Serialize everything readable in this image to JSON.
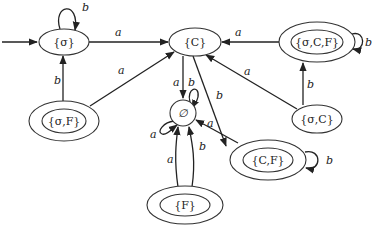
{
  "diagram": {
    "type": "finite-automaton",
    "start_state": "sigma",
    "states": {
      "sigma": {
        "label": "{σ}",
        "accepting": false
      },
      "C": {
        "label": "{C}",
        "accepting": false
      },
      "sigma_C_F": {
        "label": "{σ,C,F}",
        "accepting": true
      },
      "sigma_F": {
        "label": "{σ,F}",
        "accepting": true
      },
      "sigma_C": {
        "label": "{σ,C}",
        "accepting": false
      },
      "empty": {
        "label": "∅",
        "accepting": false
      },
      "C_F": {
        "label": "{C,F}",
        "accepting": true
      },
      "F": {
        "label": "{F}",
        "accepting": true
      }
    },
    "transitions": [
      {
        "from": "sigma",
        "to": "sigma",
        "symbol": "b"
      },
      {
        "from": "sigma",
        "to": "C",
        "symbol": "a"
      },
      {
        "from": "sigma_F",
        "to": "sigma",
        "symbol": "b"
      },
      {
        "from": "sigma_F",
        "to": "C",
        "symbol": "a"
      },
      {
        "from": "sigma_C_F",
        "to": "C",
        "symbol": "a"
      },
      {
        "from": "sigma_C_F",
        "to": "sigma_C_F",
        "symbol": "b"
      },
      {
        "from": "sigma_C",
        "to": "sigma_C_F",
        "symbol": "b"
      },
      {
        "from": "sigma_C",
        "to": "C",
        "symbol": "a"
      },
      {
        "from": "C",
        "to": "empty",
        "symbol": "a"
      },
      {
        "from": "C",
        "to": "C_F",
        "symbol": "b"
      },
      {
        "from": "empty",
        "to": "empty",
        "symbol": "a"
      },
      {
        "from": "empty",
        "to": "empty",
        "symbol": "b"
      },
      {
        "from": "C_F",
        "to": "empty",
        "symbol": "a"
      },
      {
        "from": "C_F",
        "to": "C_F",
        "symbol": "b"
      },
      {
        "from": "F",
        "to": "empty",
        "symbol": "a"
      },
      {
        "from": "F",
        "to": "empty",
        "symbol": "b"
      }
    ],
    "edge_labels": {
      "sigma_loop": "b",
      "sigma_to_C": "a",
      "sigmaF_to_sigma": "b",
      "sigmaF_to_C": "a",
      "sigmaCF_to_C": "a",
      "sigmaCF_loop": "b",
      "sigmaC_to_sigmaCF": "b",
      "sigmaC_to_C": "a",
      "C_to_empty": "a",
      "C_to_CF": "b",
      "empty_loop_a": "a",
      "empty_loop_b": "b",
      "CF_to_empty": "a",
      "CF_loop": "b",
      "F_to_empty_a": "a",
      "F_to_empty_b": "b"
    },
    "colors": {
      "stroke": "#222222",
      "background": "#ffffff"
    }
  }
}
